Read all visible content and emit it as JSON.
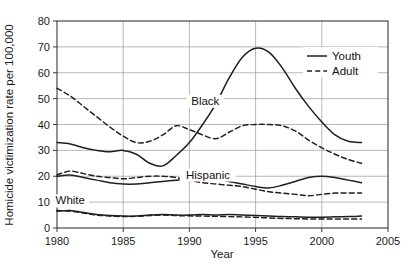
{
  "chart_data": {
    "type": "line",
    "title": "",
    "xlabel": "Year",
    "ylabel": "Homicide victimization rate per 100,000",
    "xlim": [
      1980,
      2005
    ],
    "ylim": [
      0,
      80
    ],
    "xticks": [
      1980,
      1985,
      1990,
      1995,
      2000,
      2005
    ],
    "yticks": [
      0,
      10,
      20,
      30,
      40,
      50,
      60,
      70,
      80
    ],
    "grid": "horizontal-and-vertical",
    "legend_position": "upper-right-inside",
    "legend": [
      {
        "name": "Youth",
        "style": "solid"
      },
      {
        "name": "Adult",
        "style": "dashed"
      }
    ],
    "annotations": [
      {
        "text": "Black",
        "x": 1991.2,
        "y": 48
      },
      {
        "text": "Hispanic",
        "x": 1991.4,
        "y": 19.5
      },
      {
        "text": "White",
        "x": 1981.0,
        "y": 9.5
      }
    ],
    "x": [
      1980,
      1981,
      1982,
      1983,
      1984,
      1985,
      1986,
      1987,
      1988,
      1989,
      1990,
      1991,
      1992,
      1993,
      1994,
      1995,
      1996,
      1997,
      1998,
      1999,
      2000,
      2001,
      2002,
      2003
    ],
    "series": [
      {
        "name": "Black Youth",
        "group": "Black",
        "style": "solid",
        "values": [
          33.0,
          32.5,
          31.0,
          30.0,
          29.5,
          30.0,
          28.5,
          25.0,
          24.0,
          28.0,
          33.0,
          40.0,
          48.0,
          58.0,
          66.0,
          69.5,
          68.0,
          62.0,
          54.0,
          47.0,
          41.0,
          36.0,
          33.5,
          33.0
        ]
      },
      {
        "name": "Black Adult",
        "group": "Black",
        "style": "dashed",
        "values": [
          54.0,
          51.0,
          47.0,
          43.0,
          39.0,
          35.5,
          33.0,
          33.5,
          36.0,
          39.5,
          38.0,
          36.0,
          34.5,
          37.0,
          39.5,
          40.0,
          40.0,
          39.5,
          37.5,
          34.0,
          31.0,
          28.5,
          26.5,
          25.0
        ]
      },
      {
        "name": "Hispanic Youth",
        "group": "Hispanic",
        "style": "solid",
        "values": [
          20.0,
          20.5,
          19.5,
          18.5,
          17.5,
          17.0,
          17.0,
          17.5,
          18.0,
          18.5,
          19.0,
          19.5,
          19.0,
          18.0,
          17.0,
          16.0,
          15.5,
          16.5,
          18.0,
          19.5,
          20.0,
          19.5,
          18.5,
          17.5
        ]
      },
      {
        "name": "Hispanic Adult",
        "group": "Hispanic",
        "style": "dashed",
        "values": [
          20.5,
          22.0,
          21.0,
          20.0,
          19.5,
          19.0,
          19.5,
          20.0,
          20.0,
          19.5,
          18.5,
          17.5,
          17.0,
          16.5,
          16.0,
          15.0,
          14.0,
          13.5,
          13.0,
          12.5,
          13.0,
          13.5,
          13.5,
          13.5
        ]
      },
      {
        "name": "White Youth",
        "group": "White",
        "style": "solid",
        "values": [
          6.5,
          6.8,
          6.0,
          5.2,
          4.8,
          4.6,
          4.6,
          5.0,
          5.2,
          5.0,
          5.0,
          5.2,
          5.0,
          5.2,
          5.0,
          4.8,
          4.6,
          4.4,
          4.3,
          4.2,
          4.2,
          4.3,
          4.4,
          4.6
        ]
      },
      {
        "name": "White Adult",
        "group": "White",
        "style": "dashed",
        "values": [
          6.8,
          6.5,
          5.8,
          5.0,
          4.6,
          4.4,
          4.5,
          4.8,
          5.0,
          4.8,
          4.7,
          4.6,
          4.5,
          4.4,
          4.3,
          4.1,
          3.9,
          3.7,
          3.6,
          3.5,
          3.5,
          3.5,
          3.5,
          3.5
        ]
      }
    ]
  },
  "axis": {
    "y_title": "Homicide victimization rate per 100,000",
    "x_title": "Year",
    "y_tick_labels": [
      "0",
      "10",
      "20",
      "30",
      "40",
      "50",
      "60",
      "70",
      "80"
    ],
    "x_tick_labels": [
      "1980",
      "1985",
      "1990",
      "1995",
      "2000",
      "2005"
    ]
  },
  "legend": {
    "youth_label": "Youth",
    "adult_label": "Adult"
  },
  "annotations": {
    "black": "Black",
    "hispanic": "Hispanic",
    "white": "White"
  },
  "colors": {
    "line": "#1f1f1f",
    "grid": "#9a9a9a",
    "axis": "#3a3a3a",
    "background": "#ffffff"
  }
}
